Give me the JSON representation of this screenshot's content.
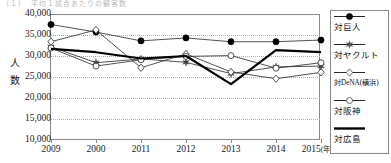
{
  "cut_title": "（１）　平均１試合あたりの観客数",
  "axes": {
    "ylabel": "人数",
    "yticks": [
      "40,000",
      "35,000",
      "30,000",
      "25,000",
      "20,000",
      "15,000",
      "10,000"
    ],
    "xticks": [
      "2009",
      "2000",
      "2011",
      "2012",
      "2013",
      "2014",
      "2015"
    ],
    "x_unit": "(年)",
    "ylim_min": 10000,
    "ylim_max": 40000,
    "grid": "dotted-horizontal"
  },
  "legend": {
    "position": "right",
    "items": [
      {
        "label": "対巨人",
        "marker": "filled-circle",
        "color": "#000000"
      },
      {
        "label": "対ヤクルト",
        "marker": "star",
        "color": "#555555"
      },
      {
        "label": "対DeNA(横浜)",
        "marker": "open-diamond",
        "color": "#555555"
      },
      {
        "label": "対阪神",
        "marker": "open-circle",
        "color": "#555555"
      },
      {
        "label": "対広島",
        "marker": "none",
        "color": "#000000"
      }
    ]
  },
  "chart_data": {
    "type": "line",
    "title": "",
    "xlabel": "(年)",
    "ylabel": "人数",
    "categories": [
      "2009",
      "2000",
      "2011",
      "2012",
      "2013",
      "2014",
      "2015"
    ],
    "ylim": [
      10000,
      40000
    ],
    "ytick_step": 5000,
    "grid": true,
    "legend_position": "right",
    "series": [
      {
        "name": "対巨人",
        "marker": "filled-circle",
        "values": [
          37500,
          35700,
          33600,
          34300,
          33400,
          33400,
          33800
        ]
      },
      {
        "name": "対ヤクルト",
        "marker": "star",
        "values": [
          32200,
          28400,
          29300,
          28500,
          25800,
          27400,
          27600
        ]
      },
      {
        "name": "対DeNA(横浜)",
        "marker": "open-diamond",
        "values": [
          33400,
          36200,
          27200,
          30500,
          26200,
          24600,
          26100
        ]
      },
      {
        "name": "対阪神",
        "marker": "open-circle",
        "values": [
          31900,
          27600,
          29100,
          29900,
          30100,
          27100,
          28400
        ]
      },
      {
        "name": "対広島",
        "marker": "none",
        "values": [
          31700,
          30900,
          29400,
          30000,
          23300,
          31400,
          30900
        ]
      }
    ]
  }
}
